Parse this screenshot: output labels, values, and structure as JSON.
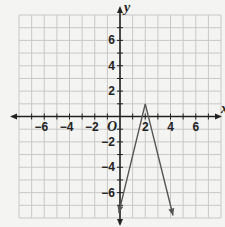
{
  "chart_data": {
    "type": "line",
    "title": "",
    "xlabel": "x",
    "ylabel": "y",
    "origin_label": "O",
    "xlim": [
      -8,
      8
    ],
    "ylim": [
      -8,
      8
    ],
    "grid": true,
    "x_tick_labels": [
      "-6",
      "-4",
      "-2",
      "2",
      "4",
      "6"
    ],
    "x_tick_values": [
      -6,
      -4,
      -2,
      2,
      4,
      6
    ],
    "y_tick_labels": [
      "6",
      "4",
      "2",
      "-2",
      "-4",
      "-6"
    ],
    "y_tick_values": [
      6,
      4,
      2,
      -2,
      -4,
      -6
    ],
    "series": [
      {
        "name": "y = -4|x - 2| + 1",
        "points": [
          [
            -0.1,
            -7.6
          ],
          [
            2,
            1
          ],
          [
            4.2,
            -7.8
          ]
        ],
        "vertex": [
          2,
          1
        ],
        "arrows_at_ends": true,
        "color": "#555555"
      }
    ]
  },
  "colors": {
    "grid": "#c8c8c8",
    "axis": "#222222",
    "line": "#555555",
    "background": "#f4f4f2"
  }
}
